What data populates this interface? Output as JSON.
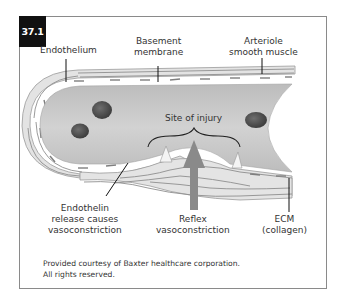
{
  "figure": {
    "number": "37.1",
    "labels": {
      "endothelium": "Endothelium",
      "basement_membrane_1": "Basement",
      "basement_membrane_2": "membrane",
      "arteriole_1": "Arteriole",
      "arteriole_2": "smooth muscle",
      "site_of_injury": "Site of injury",
      "endothelin_1": "Endothelin",
      "endothelin_2": "release causes",
      "endothelin_3": "vasoconstriction",
      "reflex_1": "Reflex",
      "reflex_2": "vasoconstriction",
      "ecm_1": "ECM",
      "ecm_2": "(collagen)"
    },
    "credit": {
      "line1": "Provided courtesy of Baxter healthcare corporation.",
      "line2": "All rights reserved."
    },
    "colors": {
      "badge_bg": "#111111",
      "frame_border": "#8a8a8a",
      "lumen": "#c9c9c9",
      "wall": "#e4e4e4",
      "wall_lines": "#8c8c8c",
      "rbc": "#5a5a5a",
      "reflex_arrow": "#8a8a8a"
    }
  }
}
